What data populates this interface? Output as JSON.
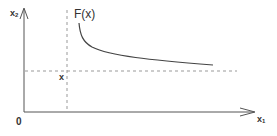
{
  "diagram": {
    "type": "function-plot-sketch",
    "labels": {
      "y_axis": "x",
      "y_axis_sub": "2",
      "x_axis": "x",
      "x_axis_sub": "1",
      "function": "F(x)",
      "origin": "0",
      "point": "x"
    },
    "colors": {
      "axis": "#555555",
      "curve": "#444444",
      "dashed": "#999999",
      "text": "#333333",
      "background": "#ffffff"
    },
    "geometry": {
      "origin": [
        24,
        112
      ],
      "x_axis_end": [
        255,
        112
      ],
      "y_axis_end": [
        24,
        8
      ],
      "vertical_dashed_x": 67,
      "horizontal_dashed_y": 71,
      "curve_start": [
        79,
        23
      ],
      "curve_end": [
        213,
        65
      ]
    }
  }
}
